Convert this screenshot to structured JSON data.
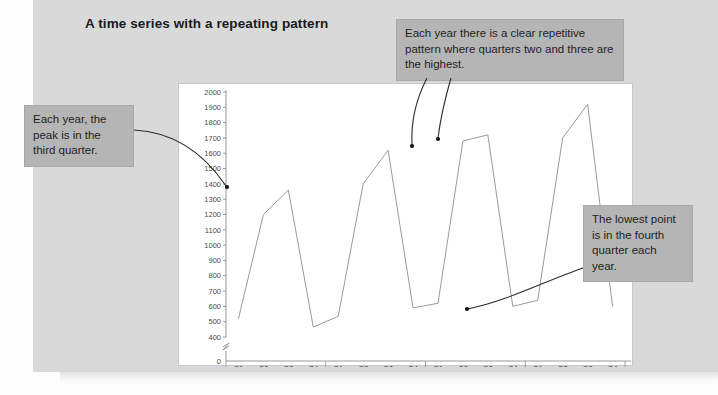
{
  "slide": {
    "title": "A time series with a repeating pattern"
  },
  "annotations": [
    {
      "id": "peak",
      "text": "Each year, the peak is in the third quarter.",
      "target_label": "2019 Q3"
    },
    {
      "id": "pattern",
      "text": "Each year there is a clear repetitive pattern where quarters two and three are the highest.",
      "target_label": "2021 Q2 and 2021 Q3"
    },
    {
      "id": "lowest",
      "text": "The lowest point is in the fourth quarter each year.",
      "target_label": "2021 Q4"
    }
  ],
  "colors": {
    "slide_background": "#d9d9d9",
    "card_background": "#ffffff",
    "callout_background": "#b5b5b5",
    "series_line": "#9a9a9a",
    "arrow": "#2b2b2b",
    "axis": "#8c8c8c"
  },
  "chart_data": {
    "type": "line",
    "title": "",
    "xlabel": "",
    "ylabel": "",
    "grid": false,
    "legend": null,
    "ylim": [
      400,
      2000
    ],
    "y_axis_break": true,
    "y_zero_tick": "0",
    "yticks": [
      400,
      500,
      600,
      700,
      800,
      900,
      1000,
      1100,
      1200,
      1300,
      1400,
      1500,
      1600,
      1700,
      1800,
      1900,
      2000
    ],
    "ytick_labels": [
      "400",
      "500",
      "600",
      "700",
      "800",
      "900",
      "1000",
      "1100",
      "1200",
      "1300",
      "1400",
      "1500",
      "1600",
      "1700",
      "1800",
      "1900",
      "2000"
    ],
    "years": [
      "2019",
      "2020",
      "2021",
      "2022"
    ],
    "quarters": [
      "Q1",
      "Q2",
      "Q3",
      "Q4"
    ],
    "categories": [
      "2019 Q1",
      "2019 Q2",
      "2019 Q3",
      "2019 Q4",
      "2020 Q1",
      "2020 Q2",
      "2020 Q3",
      "2020 Q4",
      "2021 Q1",
      "2021 Q2",
      "2021 Q3",
      "2021 Q4",
      "2022 Q1",
      "2022 Q2",
      "2022 Q3",
      "2022 Q4"
    ],
    "values": [
      520,
      1200,
      1360,
      465,
      535,
      1400,
      1620,
      590,
      620,
      1680,
      1720,
      600,
      640,
      1700,
      1920,
      600
    ],
    "annotated_points": [
      {
        "category": "2019 Q3",
        "value": 1360
      },
      {
        "category": "2021 Q2",
        "value": 1680
      },
      {
        "category": "2021 Q3",
        "value": 1720
      },
      {
        "category": "2021 Q4",
        "value": 600
      }
    ]
  }
}
